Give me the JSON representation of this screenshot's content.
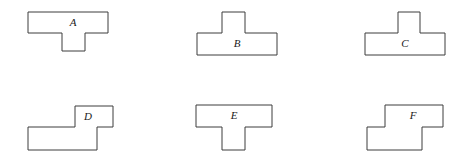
{
  "figure": {
    "background_color": "#ffffff",
    "stroke_color": "#3d3d3d",
    "label_color": "#1a1a1a",
    "width": 468,
    "height": 164
  },
  "shapes": [
    {
      "label": "A",
      "name": "shape-a",
      "description": "T-shape with stem pointing down",
      "points": "28,12 108,12 108,33 85,33 85,51 62,51 62,33 28,33",
      "label_x": 73,
      "label_y": 23
    },
    {
      "label": "B",
      "name": "shape-b",
      "description": "T-shape with stem pointing up, stem left of center",
      "points": "222,12 245,12 245,33 277,33 277,55 197,55 197,33 222,33",
      "label_x": 237,
      "label_y": 44
    },
    {
      "label": "C",
      "name": "shape-c",
      "description": "T-shape with stem pointing up, stem centered",
      "points": "398,12 420,12 420,33 445,33 445,55 365,55 365,33 398,33",
      "label_x": 405,
      "label_y": 44
    },
    {
      "label": "D",
      "name": "shape-d",
      "description": "Z/S-shape, upper block offset right",
      "points": "75,106 113,106 113,127 97,127 97,150 28,150 28,127 75,127",
      "label_x": 88,
      "label_y": 117
    },
    {
      "label": "E",
      "name": "shape-e",
      "description": "T-shape with stem pointing down",
      "points": "196,105 272,105 272,127 245,127 245,150 222,150 222,127 196,127",
      "label_x": 234,
      "label_y": 116
    },
    {
      "label": "F",
      "name": "shape-f",
      "description": "Z/S-shape, upper block offset right",
      "points": "385,105 443,105 443,127 422,127 422,150 367,150 367,127 385,127",
      "label_x": 413,
      "label_y": 116
    }
  ]
}
